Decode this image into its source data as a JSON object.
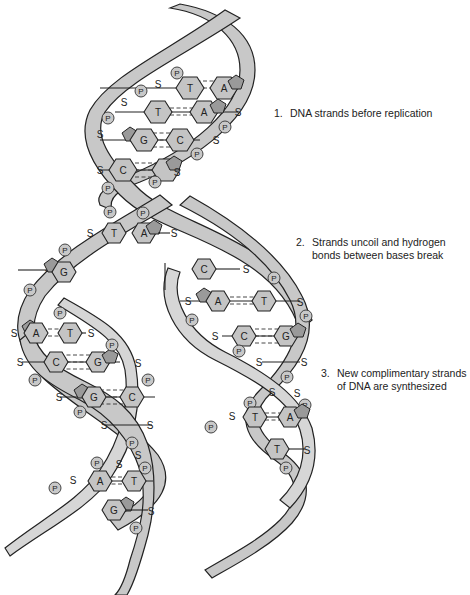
{
  "captions": [
    {
      "number": "1.",
      "lines": [
        "DNA strands before replication"
      ]
    },
    {
      "number": "2.",
      "lines": [
        "Strands uncoil and hydrogen",
        "bonds between bases break"
      ]
    },
    {
      "number": "3.",
      "lines": [
        "New complimentary strands",
        "of DNA are synthesized"
      ]
    }
  ],
  "labels": {
    "phosphate": "P",
    "sugar": "S"
  },
  "base_pairs": {
    "top_helix": [
      [
        "T",
        "A"
      ],
      [
        "T",
        "A"
      ],
      [
        "G",
        "C"
      ],
      [
        "C",
        "G"
      ]
    ],
    "unzipped_left": [
      "T",
      "G"
    ],
    "unzipped_right": [
      "A",
      "C"
    ],
    "left_daughter": [
      [
        "A",
        "T"
      ],
      [
        "C",
        "G"
      ],
      [
        "G",
        "C"
      ],
      [
        "A",
        "T"
      ],
      [
        "G",
        ""
      ]
    ],
    "right_daughter": [
      [
        "A",
        "T"
      ],
      [
        "C",
        "G"
      ],
      [
        "T",
        "A"
      ],
      [
        "T",
        ""
      ]
    ]
  },
  "colors": {
    "strand_fill": "#c8c8c8",
    "base_fill": "#c4c4c4",
    "sugar_pent_fill": "#9a9a9a",
    "outline": "#222222"
  }
}
